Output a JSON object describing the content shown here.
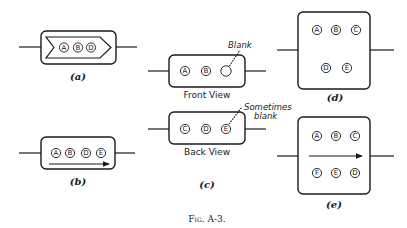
{
  "figure": {
    "caption": "Fig. A-3.",
    "panels": {
      "a": {
        "label": "(a)",
        "circles": [
          "A",
          "B",
          "D"
        ],
        "arrow": "chevron-right"
      },
      "b": {
        "label": "(b)",
        "circles": [
          "A",
          "B",
          "D",
          "E"
        ],
        "arrow": "right"
      },
      "c": {
        "label": "(c)",
        "front": {
          "title": "Front View",
          "circles": [
            "A",
            "B",
            ""
          ],
          "annotation": "Blank"
        },
        "back": {
          "title": "Back View",
          "circles": [
            "C",
            "D",
            "E"
          ],
          "annotation_line1": "Sometimes",
          "annotation_line2": "blank"
        }
      },
      "d": {
        "label": "(d)",
        "row1": [
          "A",
          "B",
          "C"
        ],
        "row2": [
          "D",
          "E"
        ]
      },
      "e": {
        "label": "(e)",
        "row1": [
          "A",
          "B",
          "C"
        ],
        "row2": [
          "F",
          "E",
          "D"
        ],
        "arrow": "right"
      }
    }
  }
}
